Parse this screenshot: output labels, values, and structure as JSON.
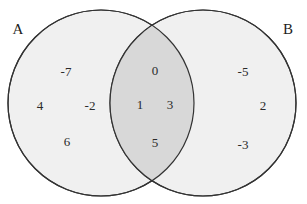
{
  "figure": {
    "type": "venn-diagram",
    "width": 307,
    "height": 204,
    "background_color": "#ffffff"
  },
  "style": {
    "circle_fill": "#f0f0f0",
    "intersection_fill": "#d8d8d8",
    "stroke_color": "#333333",
    "text_color": "#2a2a2a",
    "label_color": "#1d1d1d"
  },
  "sets": [
    {
      "name": "set-a",
      "label": "A",
      "label_x": 18,
      "label_y": 29,
      "circle": {
        "cx": 101,
        "cy": 103,
        "r": 93
      }
    },
    {
      "name": "set-b",
      "label": "B",
      "label_x": 288,
      "label_y": 29,
      "circle": {
        "cx": 203,
        "cy": 103,
        "r": 93
      }
    }
  ],
  "regions": {
    "a_only": {
      "name": "region-a-only",
      "description": "elements only in A",
      "elements": [
        {
          "value": "-7",
          "x": 66,
          "y": 71
        },
        {
          "value": "4",
          "x": 40,
          "y": 105
        },
        {
          "value": "-2",
          "x": 90,
          "y": 105
        },
        {
          "value": "6",
          "x": 67,
          "y": 141
        }
      ]
    },
    "intersection": {
      "name": "region-a-and-b",
      "description": "elements in both A and B",
      "elements": [
        {
          "value": "0",
          "x": 155,
          "y": 70
        },
        {
          "value": "1",
          "x": 140,
          "y": 104
        },
        {
          "value": "3",
          "x": 170,
          "y": 104
        },
        {
          "value": "5",
          "x": 155,
          "y": 142
        }
      ]
    },
    "b_only": {
      "name": "region-b-only",
      "description": "elements only in B",
      "elements": [
        {
          "value": "-5",
          "x": 243,
          "y": 71
        },
        {
          "value": "2",
          "x": 263,
          "y": 105
        },
        {
          "value": "-3",
          "x": 243,
          "y": 144
        }
      ]
    }
  },
  "chart_data": {
    "type": "diagram",
    "subtype": "venn",
    "title": "",
    "set_labels": [
      "A",
      "B"
    ],
    "a_only_values": [
      -7,
      4,
      -2,
      6
    ],
    "intersection_values": [
      0,
      1,
      3,
      5
    ],
    "b_only_values": [
      -5,
      2,
      -3
    ],
    "a_all_values": [
      -7,
      4,
      -2,
      6,
      0,
      1,
      3,
      5
    ],
    "b_all_values": [
      0,
      1,
      3,
      5,
      -5,
      2,
      -3
    ],
    "counts": {
      "a_only": 4,
      "intersection": 4,
      "b_only": 3,
      "total": 11
    }
  }
}
